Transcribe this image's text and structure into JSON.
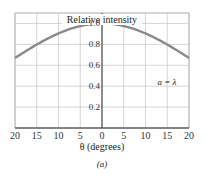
{
  "chart_data": {
    "type": "line",
    "title": "Relative intensity",
    "xlabel": "θ (degrees)",
    "ylabel": "Relative intensity",
    "caption": "(a)",
    "annotation": "a = λ",
    "x": [
      -20,
      -15,
      -10,
      -5,
      0,
      5,
      10,
      15,
      20
    ],
    "series": [
      {
        "name": "a = λ",
        "values": [
          0.67,
          0.8,
          0.91,
          0.98,
          1.0,
          0.98,
          0.91,
          0.8,
          0.67
        ]
      }
    ],
    "x_tick_labels": [
      "20",
      "15",
      "10",
      "5",
      "0",
      "5",
      "10",
      "15",
      "20"
    ],
    "y_tick_labels": [
      "0.2",
      "0.4",
      "0.6",
      "0.8",
      "1.0"
    ],
    "y_ticks": [
      0.2,
      0.4,
      0.6,
      0.8,
      1.0
    ],
    "xlim": [
      -20,
      20
    ],
    "ylim": [
      0,
      1.1
    ],
    "grid": true,
    "curve_color": "#8a8a8a"
  }
}
